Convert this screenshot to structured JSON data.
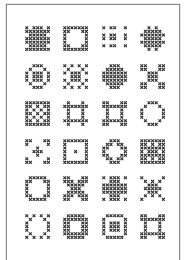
{
  "sheet": {
    "title": "",
    "stitch_color": "#2e2e2e",
    "frame_color": "#8a8a8a",
    "rows": 6,
    "cols": 4
  },
  "motifs": [
    {
      "name": "diagonal-cross-block",
      "pattern": [
        "X.XXX.X",
        "XXXXXXX",
        ".XXXXX.",
        "XXXXXXX",
        "XXXXXXX",
        ".XXXXX.",
        "XXXXXXX"
      ]
    },
    {
      "name": "square-frame-round-hole",
      "pattern": [
        "XXXXXXX",
        "XX...XX",
        "X.....X",
        "X.....X",
        "X.....X",
        "XX...XX",
        "XXXXXXX"
      ]
    },
    {
      "name": "nine-dot-grid",
      "pattern": [
        "X.XX..X",
        ".......",
        "X.XX..X",
        "X.XX..X",
        ".......",
        "X.XX..X",
        "......."
      ]
    },
    {
      "name": "cross-star-block",
      "pattern": [
        "..X.X..",
        ".XXXXX.",
        "XXXXXXX",
        ".XXXXX.",
        "XXXXXXX",
        ".XXXXX.",
        "..X.X.."
      ]
    },
    {
      "name": "ring-with-center",
      "pattern": [
        "..XXX..",
        ".X...X.",
        "X.XXX.X",
        "X.XXX.X",
        "X.XXX.X",
        ".X...X.",
        "..XXX.."
      ]
    },
    {
      "name": "lattice-diamond",
      "pattern": [
        "X.X.X.X",
        ".X...X.",
        "X.XXX.X",
        "..XXX..",
        "X.XXX.X",
        ".X...X.",
        "X.X.X.X"
      ]
    },
    {
      "name": "solid-diamond",
      "pattern": [
        "..XXX..",
        ".XXXXX.",
        "XXXXXXX",
        "XXXXXXX",
        "XXXXXXX",
        ".XXXXX.",
        "..XXX.."
      ]
    },
    {
      "name": "five-squares",
      "pattern": [
        "XX...XX",
        "XX...XX",
        "..XXX..",
        "..XXX..",
        "..XXX..",
        "XX...XX",
        "XX...XX"
      ]
    },
    {
      "name": "checkered-square",
      "pattern": [
        "XXXXXXX",
        "XX.X.XX",
        "X.X.X.X",
        "XX.X.XX",
        "X.X.X.X",
        "XX.X.XX",
        "XXXXXXX"
      ]
    },
    {
      "name": "hash-square",
      "pattern": [
        ".X...X.",
        "XXXXXXX",
        ".X...X.",
        ".X...X.",
        ".X...X.",
        "XXXXXXX",
        ".X...X."
      ]
    },
    {
      "name": "cornered-ring",
      "pattern": [
        "XX...XX",
        "XXXXXXX",
        ".X...X.",
        ".X...X.",
        ".X...X.",
        "XXXXXXX",
        "XX...XX"
      ]
    },
    {
      "name": "octagon-ring",
      "pattern": [
        "..XXX..",
        ".X...X.",
        "X.....X",
        "X.....X",
        "X.....X",
        ".X...X.",
        "..XXX.."
      ]
    },
    {
      "name": "corner-brackets",
      "pattern": [
        "XX...XX",
        "X.....X",
        "...X...",
        "..XXX..",
        "...X...",
        "X.....X",
        "XX...XX"
      ]
    },
    {
      "name": "framed-center",
      "pattern": [
        "XXXXXXX",
        "X.....X",
        "X.....X",
        "X..X..X",
        "X.....X",
        "X.....X",
        "XXXXXXX"
      ]
    },
    {
      "name": "octagon-outline",
      "pattern": [
        "..XXX..",
        ".XX.XX.",
        "XX...XX",
        "X.....X",
        "XX...XX",
        ".XX.XX.",
        "..XXX.."
      ]
    },
    {
      "name": "dense-square",
      "pattern": [
        "XXXXXXX",
        "XX.X.XX",
        "XXXXXXX",
        "X.XXX.X",
        "XXXXXXX",
        "XX.X.XX",
        "XXXXXXX"
      ]
    },
    {
      "name": "round-frame",
      "pattern": [
        ".XXXXX.",
        "XX...XX",
        "X.....X",
        "X.....X",
        "X.....X",
        "XX...XX",
        ".XXXXX."
      ]
    },
    {
      "name": "x-shape",
      "pattern": [
        "XX...XX",
        "XXX.XXX",
        ".XXXXX.",
        "..XXX..",
        ".XXXXX.",
        "XXX.XXX",
        "XX...XX"
      ]
    },
    {
      "name": "plus-shape",
      "pattern": [
        "X.XXX.X",
        "..XXX..",
        "XXXXXXX",
        "XXXXXXX",
        "XXXXXXX",
        "..XXX..",
        "X.XXX.X"
      ]
    },
    {
      "name": "star-burst",
      "pattern": [
        "X.....X",
        ".X.X.X.",
        "..XXX..",
        ".XXXXX.",
        "..XXX..",
        ".X.X.X.",
        "X.....X"
      ]
    },
    {
      "name": "dotted-ring",
      "pattern": [
        "X.X.X.X",
        ".X...X.",
        "X.....X",
        "X.....X",
        "X.....X",
        ".X...X.",
        "X.X.X.X"
      ]
    },
    {
      "name": "thick-ring",
      "pattern": [
        ".XXXXX.",
        "XXXXXXX",
        "XX...XX",
        "XX...XX",
        "XX...XX",
        "XXXXXXX",
        ".XXXXX."
      ]
    },
    {
      "name": "nested-square",
      "pattern": [
        ".XXXXX.",
        "X.....X",
        "X.XXX.X",
        "X.XXX.X",
        "X.XXX.X",
        "X.....X",
        ".XXXXX."
      ]
    },
    {
      "name": "corner-box",
      "pattern": [
        "XX...XX",
        "XXXXXXX",
        ".X...X.",
        ".X...X.",
        ".X...X.",
        "XXXXXXX",
        "XX...XX"
      ]
    }
  ]
}
